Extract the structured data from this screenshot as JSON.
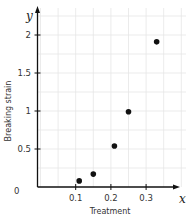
{
  "chart_data": {
    "type": "scatter",
    "title": "",
    "xlabel": "Treatment",
    "ylabel": "Breaking strain",
    "x_axis_var": "x",
    "y_axis_var": "y",
    "xlim": [
      0,
      0.4
    ],
    "ylim": [
      0,
      2.2
    ],
    "x_ticks": [
      "0.1",
      "0.2",
      "0.3"
    ],
    "y_ticks": [
      "0.5",
      "1",
      "1.5",
      "2"
    ],
    "origin_label": "0",
    "grid": true,
    "series": [
      {
        "name": "data",
        "x": [
          0.11,
          0.15,
          0.21,
          0.25,
          0.33
        ],
        "y": [
          0.08,
          0.17,
          0.54,
          0.99,
          1.91
        ]
      }
    ],
    "colors": {
      "points": "#111111",
      "axes": "#111111",
      "grid": "#e6e6e6"
    }
  }
}
